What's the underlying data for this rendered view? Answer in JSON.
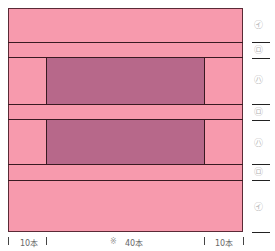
{
  "diagram": {
    "colors": {
      "background_fabric": "#f79aad",
      "inner_block": "#b7688a",
      "line": "#3a1a22"
    },
    "sections": [
      {
        "marker": "㋑",
        "label": "top-band"
      },
      {
        "marker": "㋺",
        "label": "strip-1"
      },
      {
        "marker": "㋩",
        "label": "block-1"
      },
      {
        "marker": "㋺",
        "label": "strip-2"
      },
      {
        "marker": "㋩",
        "label": "block-2"
      },
      {
        "marker": "㋺",
        "label": "strip-3"
      },
      {
        "marker": "㋑",
        "label": "bottom-band"
      }
    ],
    "bottom_labels": {
      "left": "10本",
      "center_mark": "※",
      "center": "40本",
      "right": "10本"
    }
  }
}
